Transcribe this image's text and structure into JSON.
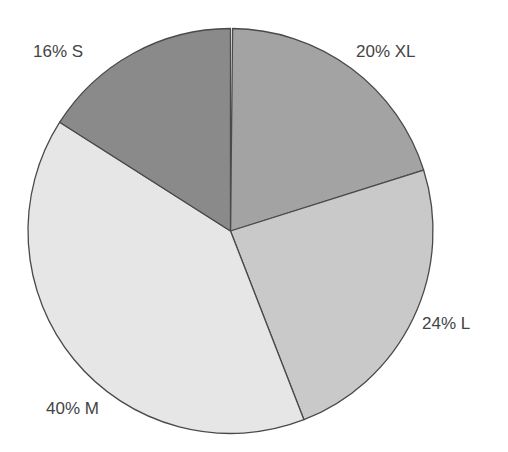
{
  "chart_data": {
    "type": "pie",
    "title": "",
    "start_angle_deg": 0,
    "direction": "clockwise",
    "categories": [
      "XL",
      "L",
      "M",
      "S"
    ],
    "values": [
      20,
      24,
      40,
      16
    ],
    "unit": "%",
    "colors": [
      "#a3a3a3",
      "#c9c9c9",
      "#e6e6e6",
      "#8a8a8a"
    ],
    "labels": [
      "20% XL",
      "24% L",
      "40% M",
      "16% S"
    ],
    "outline_color": "#4a4a4a",
    "legend": "none"
  },
  "labels": {
    "xl": "20% XL",
    "l": "24% L",
    "m": "40% M",
    "s": "16% S"
  }
}
